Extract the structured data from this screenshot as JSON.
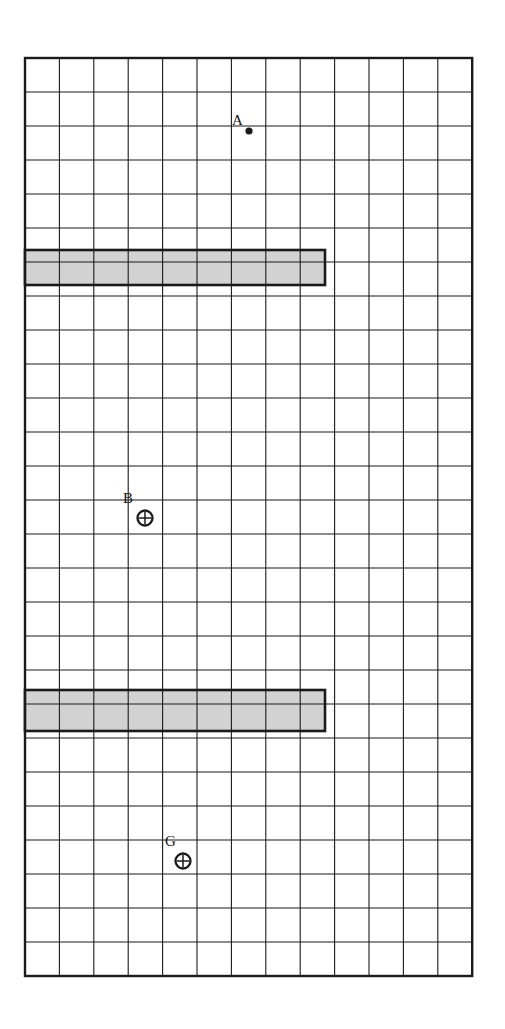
{
  "figure": {
    "title": "",
    "background_color": "#ffffff",
    "line_color": "#1a1a1a",
    "shade_color": "#d2d2d2",
    "grid": {
      "origin_x": 25,
      "origin_y": 58,
      "columns": 13,
      "rows": 27,
      "cell_width": 34.4,
      "cell_height": 34.0,
      "border_width": 2.4,
      "inner_line_width": 1.1
    },
    "shaded_bars": [
      {
        "name": "upper-shaded-bar",
        "col_start": 0,
        "col_span": 9,
        "row_start": 5,
        "row_span": 1,
        "x": 25,
        "y": 250,
        "width": 300,
        "height": 35,
        "fill": "#d2d2d2",
        "stroke": "#1a1a1a",
        "stroke_width": 2.6
      },
      {
        "name": "lower-shaded-bar",
        "col_start": 0,
        "col_span": 9,
        "row_start": 18.6,
        "row_span": 1.2,
        "x": 25,
        "y": 690,
        "width": 300,
        "height": 41,
        "fill": "#d2d2d2",
        "stroke": "#1a1a1a",
        "stroke_width": 2.6
      }
    ],
    "markers": [
      {
        "name": "point-a",
        "label": "A",
        "type": "filled-dot",
        "x": 249,
        "y": 131,
        "radius": 3.6,
        "label_x": 232,
        "label_y": 113
      },
      {
        "name": "point-b",
        "label": "B",
        "type": "crosshair-circle",
        "x": 145,
        "y": 518,
        "radius": 7.5,
        "label_x": 123,
        "label_y": 491
      },
      {
        "name": "point-g",
        "label": "G",
        "type": "crosshair-circle",
        "x": 183,
        "y": 861,
        "radius": 7.5,
        "label_x": 165,
        "label_y": 834
      }
    ]
  },
  "chart_data": {
    "type": "table",
    "title": "",
    "xlabel": "",
    "ylabel": "",
    "grid_columns": 13,
    "grid_rows": 27,
    "legend_position": "none",
    "categories": [
      "A",
      "B",
      "G"
    ],
    "points": [
      {
        "label": "A",
        "col": 7,
        "row": 2,
        "symbol": "filled dot"
      },
      {
        "label": "B",
        "col": 4,
        "row": 13,
        "symbol": "circle with cross"
      },
      {
        "label": "G",
        "col": 5,
        "row": 23,
        "symbol": "circle with cross"
      }
    ],
    "shaded_regions": [
      {
        "name": "upper bar",
        "columns": "1-9",
        "rows": "6",
        "width_cells": 9,
        "height_cells": 1
      },
      {
        "name": "lower bar",
        "columns": "1-9",
        "rows": "19-20",
        "width_cells": 9,
        "height_cells": 1.2
      }
    ]
  }
}
